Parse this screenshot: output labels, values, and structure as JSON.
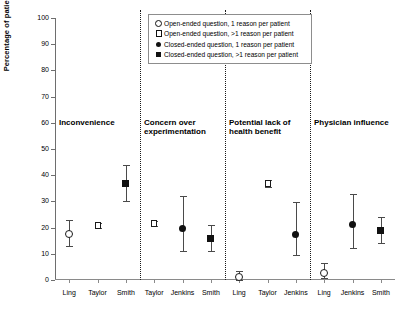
{
  "chart_data": {
    "type": "scatter",
    "title": "",
    "xlabel": "",
    "ylabel": "Percentage of patients",
    "ylim": [
      0,
      100
    ],
    "yticks": [
      0,
      10,
      20,
      30,
      40,
      50,
      60,
      70,
      80,
      90,
      100
    ],
    "ytick_labels": [
      "0",
      "10",
      "20",
      "30",
      "40",
      "50",
      "60",
      "70",
      "80",
      "90",
      "100"
    ],
    "grid": false,
    "legend_position": "top-center",
    "legend": [
      {
        "marker": "open-circle",
        "label": "Open-ended question, 1 reason per patient"
      },
      {
        "marker": "open-square",
        "label": "Open-ended question, >1 reason per patient"
      },
      {
        "marker": "closed-circle",
        "label": "Closed-ended question, 1 reason per patient"
      },
      {
        "marker": "closed-square",
        "label": "Closed-ended question, >1 reason per patient"
      }
    ],
    "groups": [
      {
        "title": "Inconvenience",
        "points": [
          {
            "x_label": "Ling",
            "marker": "open-circle",
            "value": 17.5,
            "ci_low": 13.0,
            "ci_high": 23.0
          },
          {
            "x_label": "Taylor",
            "marker": "open-square",
            "value": 20.8,
            "ci_low": 19.8,
            "ci_high": 21.8
          },
          {
            "x_label": "Smith",
            "marker": "closed-square",
            "value": 36.8,
            "ci_low": 30.0,
            "ci_high": 44.0
          }
        ]
      },
      {
        "title": "Concern over experimentation",
        "points": [
          {
            "x_label": "Taylor",
            "marker": "open-square",
            "value": 21.5,
            "ci_low": 20.6,
            "ci_high": 22.4
          },
          {
            "x_label": "Jenkins",
            "marker": "closed-circle",
            "value": 19.4,
            "ci_low": 11.0,
            "ci_high": 32.0
          },
          {
            "x_label": "Smith",
            "marker": "closed-square",
            "value": 15.5,
            "ci_low": 11.0,
            "ci_high": 21.0
          }
        ]
      },
      {
        "title": "Potential lack of health benefit",
        "points": [
          {
            "x_label": "Ling",
            "marker": "open-circle",
            "value": 1.0,
            "ci_low": 0.0,
            "ci_high": 3.5
          },
          {
            "x_label": "Taylor",
            "marker": "open-square",
            "value": 36.9,
            "ci_low": 35.6,
            "ci_high": 38.2
          },
          {
            "x_label": "Jenkins",
            "marker": "closed-circle",
            "value": 17.3,
            "ci_low": 9.5,
            "ci_high": 29.8
          }
        ]
      },
      {
        "title": "Physician influence",
        "points": [
          {
            "x_label": "Ling",
            "marker": "open-circle",
            "value": 2.8,
            "ci_low": 0.6,
            "ci_high": 6.4
          },
          {
            "x_label": "Jenkins",
            "marker": "closed-circle",
            "value": 21.1,
            "ci_low": 12.4,
            "ci_high": 33.0
          },
          {
            "x_label": "Smith",
            "marker": "closed-square",
            "value": 18.8,
            "ci_low": 14.0,
            "ci_high": 24.0
          }
        ]
      }
    ]
  }
}
